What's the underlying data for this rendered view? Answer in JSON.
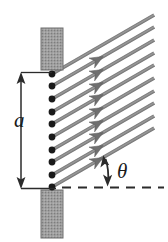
{
  "figure": {
    "name": "single-slit-diffraction-geometry",
    "background_color": "#ffffff",
    "width": 168,
    "height": 242,
    "labels": {
      "slit_width": "a",
      "angle": "θ"
    },
    "colors": {
      "barrier_fill": "#9a9a9a",
      "barrier_stroke": "#6e6e6e",
      "ray": "#8a8a8a",
      "ray_edge": "#6b6b6b",
      "source_dot": "#1a1a1a",
      "dimension_line": "#2b2b2b",
      "dashed_axis": "#2b2b2b",
      "label_text": "#1a1a1a"
    },
    "barriers": [
      {
        "name": "top-barrier-block",
        "x": 41,
        "y": 28,
        "width": 22,
        "height": 42
      },
      {
        "name": "bottom-barrier-block",
        "x": 41,
        "y": 190,
        "width": 22,
        "height": 48
      }
    ],
    "slit": {
      "name": "slit-aperture",
      "x": 52,
      "top_y": 74,
      "bottom_y": 187,
      "source_point_count": 10,
      "source_points_y": [
        74,
        86,
        99,
        112,
        124,
        137,
        150,
        162,
        175,
        187
      ],
      "dot_radius": 3.4
    },
    "rays": {
      "name": "wavelet-ray-bundle",
      "count": 10,
      "angle_degrees": 30,
      "direction": "up-right",
      "thickness": 3.6,
      "arrowhead_position": "mid-ray",
      "arrowhead_count_visible": 8
    },
    "dimension": {
      "name": "slit-width-dimension-a",
      "x": 21,
      "top_y": 74,
      "bottom_y": 187,
      "tick_to_x": 52,
      "style": "double-headed-arrow"
    },
    "axis": {
      "name": "horizontal-reference-axis",
      "y": 187,
      "x_start": 62,
      "x_end": 164,
      "style": "dashed"
    },
    "angle_marker": {
      "name": "theta-angle-arc-arrow",
      "vertex_x": 52,
      "vertex_y": 187,
      "from_degrees": 0,
      "to_degrees": 30,
      "radius": 56,
      "style": "double-headed-arc-arrow"
    }
  }
}
